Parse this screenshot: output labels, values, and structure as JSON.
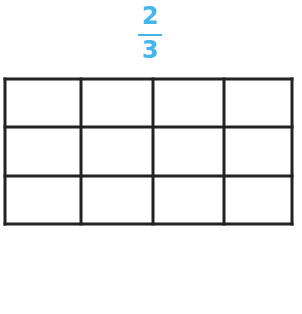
{
  "fraction": {
    "numerator": "2",
    "denominator": "3",
    "color": "#45b6ea"
  },
  "grid": {
    "rows": 3,
    "columns": 4,
    "x_lines": [
      5,
      81,
      153,
      224,
      292
    ],
    "y_lines": [
      79,
      127,
      176,
      224
    ],
    "stroke": "#222222",
    "stroke_width": 3,
    "shaded_cells": []
  }
}
